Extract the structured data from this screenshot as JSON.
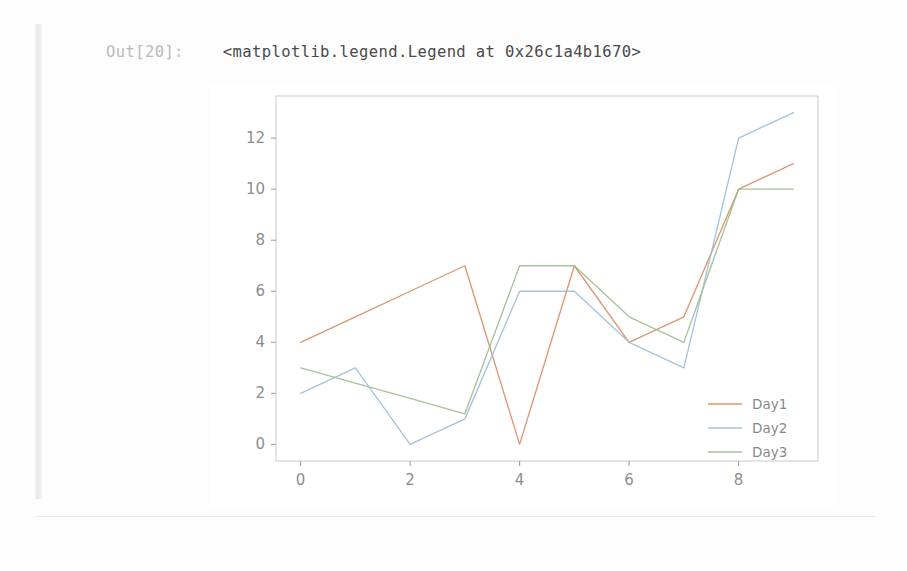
{
  "notebook": {
    "prompt": "Out[20]:",
    "repr_text": "<matplotlib.legend.Legend at 0x26c1a4b1670>"
  },
  "figure": {
    "frame_color": "#c9c9c9",
    "tick_color": "#9a9a9a",
    "background": "#ffffff"
  },
  "chart_data": {
    "type": "line",
    "title": "",
    "xlabel": "",
    "ylabel": "",
    "xlim": [
      -0.45,
      9.45
    ],
    "ylim": [
      -0.65,
      13.65
    ],
    "xticks": [
      0,
      2,
      4,
      6,
      8
    ],
    "yticks": [
      0,
      2,
      4,
      6,
      8,
      10,
      12
    ],
    "grid": false,
    "legend_position": "lower right",
    "x": [
      0,
      1,
      2,
      3,
      4,
      5,
      6,
      7,
      8,
      9
    ],
    "series": [
      {
        "name": "Day1",
        "color": "#d98b5f",
        "values": [
          4,
          5,
          6,
          7,
          0,
          7,
          4,
          5,
          10,
          11
        ]
      },
      {
        "name": "Day2",
        "color": "#9bbcd8",
        "values": [
          2,
          3,
          0,
          1,
          6,
          6,
          4,
          3,
          12,
          13
        ]
      },
      {
        "name": "Day3",
        "color": "#9fbb8e",
        "values": [
          3,
          2.4,
          1.8,
          1.2,
          7,
          7,
          5,
          4,
          10,
          10
        ]
      }
    ]
  },
  "legend": {
    "entries": [
      {
        "label": "Day1",
        "color": "#d98b5f"
      },
      {
        "label": "Day2",
        "color": "#9bbcd8"
      },
      {
        "label": "Day3",
        "color": "#9fbb8e"
      }
    ]
  }
}
